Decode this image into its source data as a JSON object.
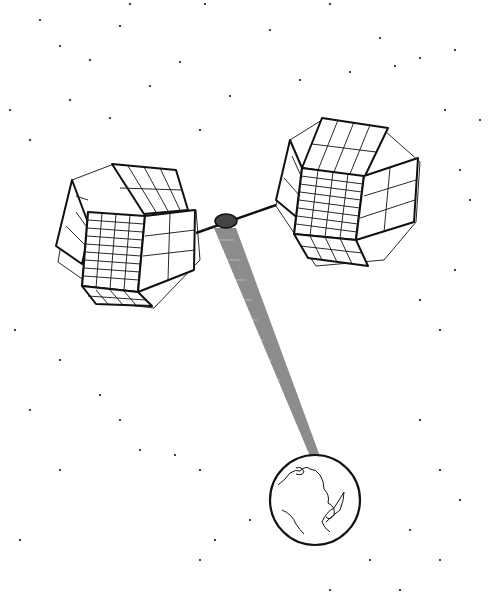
{
  "illustration": {
    "subject": "Satellite with two solar panel arrays beaming energy to Earth",
    "colors": {
      "ink": "#111111",
      "background": "#ffffff",
      "beam": "#555555"
    },
    "stars": [
      [
        130,
        4
      ],
      [
        205,
        4
      ],
      [
        330,
        4
      ],
      [
        40,
        20
      ],
      [
        120,
        26
      ],
      [
        270,
        30
      ],
      [
        380,
        38
      ],
      [
        455,
        50
      ],
      [
        60,
        46
      ],
      [
        90,
        60
      ],
      [
        180,
        62
      ],
      [
        350,
        72
      ],
      [
        395,
        66
      ],
      [
        420,
        58
      ],
      [
        150,
        86
      ],
      [
        230,
        96
      ],
      [
        300,
        80
      ],
      [
        10,
        110
      ],
      [
        70,
        100
      ],
      [
        110,
        118
      ],
      [
        200,
        130
      ],
      [
        445,
        110
      ],
      [
        480,
        120
      ],
      [
        30,
        140
      ],
      [
        460,
        170
      ],
      [
        470,
        200
      ],
      [
        455,
        270
      ],
      [
        420,
        300
      ],
      [
        440,
        330
      ],
      [
        15,
        330
      ],
      [
        60,
        360
      ],
      [
        100,
        395
      ],
      [
        30,
        410
      ],
      [
        120,
        420
      ],
      [
        140,
        450
      ],
      [
        175,
        455
      ],
      [
        200,
        470
      ],
      [
        60,
        470
      ],
      [
        420,
        420
      ],
      [
        440,
        470
      ],
      [
        460,
        500
      ],
      [
        410,
        530
      ],
      [
        370,
        560
      ],
      [
        330,
        590
      ],
      [
        200,
        560
      ],
      [
        215,
        540
      ],
      [
        250,
        520
      ],
      [
        400,
        590
      ],
      [
        440,
        560
      ],
      [
        20,
        540
      ]
    ]
  }
}
